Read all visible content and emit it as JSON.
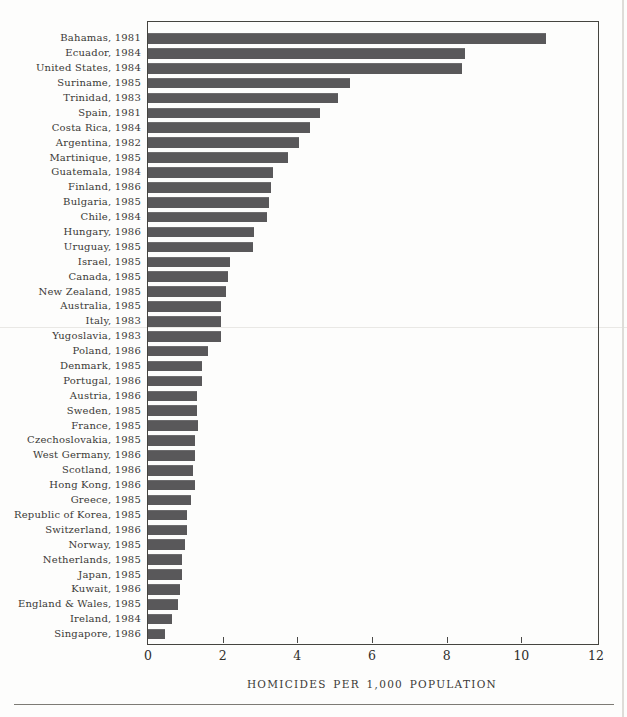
{
  "figure": {
    "kind": "scanned-book-bar-chart",
    "bottom_rule": true
  },
  "chart_data": {
    "type": "bar",
    "orientation": "horizontal",
    "title": "",
    "xlabel": "HOMICIDES PER 1,000 POPULATION",
    "ylabel": "",
    "xlim": [
      0,
      12
    ],
    "x_ticks": [
      0,
      2,
      4,
      6,
      8,
      10,
      12
    ],
    "grid": false,
    "legend": false,
    "bar_color": "#59585a",
    "categories": [
      "Bahamas, 1981",
      "Ecuador, 1984",
      "United States, 1984",
      "Suriname, 1985",
      "Trinidad, 1983",
      "Spain, 1981",
      "Costa Rica, 1984",
      "Argentina, 1982",
      "Martinique, 1985",
      "Guatemala, 1984",
      "Finland, 1986",
      "Bulgaria, 1985",
      "Chile, 1984",
      "Hungary, 1986",
      "Uruguay, 1985",
      "Israel, 1985",
      "Canada, 1985",
      "New Zealand, 1985",
      "Australia, 1985",
      "Italy, 1983",
      "Yugoslavia, 1983",
      "Poland, 1986",
      "Denmark, 1985",
      "Portugal, 1986",
      "Austria, 1986",
      "Sweden, 1985",
      "France, 1985",
      "Czechoslovakia, 1985",
      "West Germany, 1986",
      "Scotland, 1986",
      "Hong Kong, 1986",
      "Greece, 1985",
      "Republic of Korea, 1985",
      "Switzerland, 1986",
      "Norway, 1985",
      "Netherlands, 1985",
      "Japan, 1985",
      "Kuwait, 1986",
      "England & Wales, 1985",
      "Ireland, 1984",
      "Singapore, 1986"
    ],
    "values": [
      10.65,
      8.5,
      8.4,
      5.4,
      5.1,
      4.6,
      4.35,
      4.05,
      3.75,
      3.35,
      3.3,
      3.25,
      3.2,
      2.85,
      2.8,
      2.2,
      2.15,
      2.1,
      1.95,
      1.95,
      1.95,
      1.6,
      1.45,
      1.45,
      1.3,
      1.3,
      1.35,
      1.25,
      1.25,
      1.2,
      1.25,
      1.15,
      1.05,
      1.05,
      1.0,
      0.9,
      0.9,
      0.85,
      0.8,
      0.65,
      0.45
    ]
  }
}
